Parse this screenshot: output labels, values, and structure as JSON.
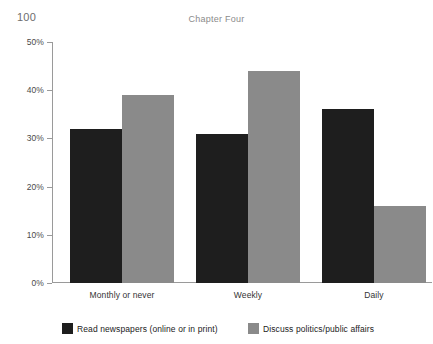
{
  "page": {
    "number": "100",
    "running_head": "Chapter Four"
  },
  "chart_data": {
    "type": "bar",
    "title": "",
    "subtitle": "",
    "xlabel": "",
    "ylabel": "",
    "ylim": [
      0,
      50
    ],
    "y_unit": "percent",
    "grid": false,
    "legend_position": "bottom",
    "categories": [
      "Monthly or never",
      "Weekly",
      "Daily"
    ],
    "y_ticks": [
      "0%",
      "10%",
      "20%",
      "30%",
      "40%",
      "50%"
    ],
    "y_tick_values": [
      0,
      10,
      20,
      30,
      40,
      50
    ],
    "series": [
      {
        "name": "Read newspapers (online or in print)",
        "color": "#1e1e1e",
        "values": [
          32,
          31,
          36
        ]
      },
      {
        "name": "Discuss politics/public affairs",
        "color": "#8a8a8a",
        "values": [
          39,
          44,
          16
        ]
      }
    ],
    "annotations": []
  }
}
